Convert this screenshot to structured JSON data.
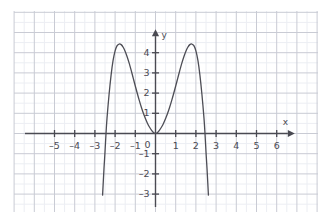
{
  "axes": {
    "x_name": "x",
    "y_name": "y",
    "origin_label": "0",
    "x_ticks": [
      {
        "value": -5,
        "label": "–5"
      },
      {
        "value": -4,
        "label": "–4"
      },
      {
        "value": -3,
        "label": "–3"
      },
      {
        "value": -2,
        "label": "–2"
      },
      {
        "value": -1,
        "label": "–1"
      },
      {
        "value": 1,
        "label": "1"
      },
      {
        "value": 2,
        "label": "2"
      },
      {
        "value": 3,
        "label": "3"
      },
      {
        "value": 4,
        "label": "4"
      },
      {
        "value": 5,
        "label": "5"
      },
      {
        "value": 6,
        "label": "6"
      }
    ],
    "y_ticks": [
      {
        "value": 4,
        "label": "4"
      },
      {
        "value": 3,
        "label": "3"
      },
      {
        "value": 2,
        "label": "2"
      },
      {
        "value": 1,
        "label": "1"
      },
      {
        "value": -1,
        "label": "–1"
      },
      {
        "value": -2,
        "label": "–2"
      },
      {
        "value": -3,
        "label": "–3"
      }
    ]
  },
  "style": {
    "grid_major_color": "#c9cbd4",
    "grid_minor_color": "#eceef3",
    "axis_color": "#4a4a52",
    "curve_color": "#4d4d55",
    "background": "#ffffff",
    "label_color": "#4a4a52"
  },
  "chart_data": {
    "type": "line",
    "title": "",
    "xlabel": "x",
    "ylabel": "y",
    "xlim": [
      -6.1,
      6.6
    ],
    "ylim": [
      -3.6,
      4.9
    ],
    "grid": true,
    "grid_major_step": 1,
    "grid_minor_step": 0.5,
    "legend": "none",
    "annotations": [],
    "curves": [
      {
        "name": "polynomial",
        "description": "even sextic-like W curve, double root at origin, peaks near x = ±1.7 at y ≈ 4.4, zeros at x ≈ ±2.45",
        "roots": [
          -2.45,
          0,
          2.45
        ],
        "local_maxima": [
          {
            "x": -1.7,
            "y": 4.4
          },
          {
            "x": 1.7,
            "y": 4.4
          }
        ],
        "local_minima": [
          {
            "x": 0,
            "y": 0
          }
        ],
        "x": [
          -2.62,
          -2.55,
          -2.5,
          -2.45,
          -2.4,
          -2.3,
          -2.2,
          -2.1,
          -2.0,
          -1.9,
          -1.8,
          -1.7,
          -1.6,
          -1.5,
          -1.4,
          -1.3,
          -1.2,
          -1.1,
          -1.0,
          -0.9,
          -0.8,
          -0.7,
          -0.6,
          -0.5,
          -0.4,
          -0.3,
          -0.2,
          -0.1,
          0.0,
          0.1,
          0.2,
          0.3,
          0.4,
          0.5,
          0.6,
          0.7,
          0.8,
          0.9,
          1.0,
          1.1,
          1.2,
          1.3,
          1.4,
          1.5,
          1.6,
          1.7,
          1.8,
          1.9,
          2.0,
          2.1,
          2.2,
          2.3,
          2.4,
          2.45,
          2.5,
          2.55,
          2.62
        ],
        "y": [
          -3.05,
          -1.73,
          -0.92,
          0.0,
          0.76,
          1.92,
          2.88,
          3.62,
          4.09,
          4.35,
          4.43,
          4.4,
          4.27,
          4.06,
          3.79,
          3.47,
          3.11,
          2.73,
          2.35,
          1.98,
          1.63,
          1.3,
          1.0,
          0.74,
          0.51,
          0.32,
          0.17,
          0.05,
          0.0,
          0.05,
          0.17,
          0.32,
          0.51,
          0.74,
          1.0,
          1.3,
          1.63,
          1.98,
          2.35,
          2.73,
          3.11,
          3.47,
          3.79,
          4.06,
          4.27,
          4.4,
          4.43,
          4.35,
          4.09,
          3.62,
          2.88,
          1.92,
          0.76,
          0.0,
          -0.92,
          -1.73,
          -3.05
        ]
      }
    ]
  }
}
